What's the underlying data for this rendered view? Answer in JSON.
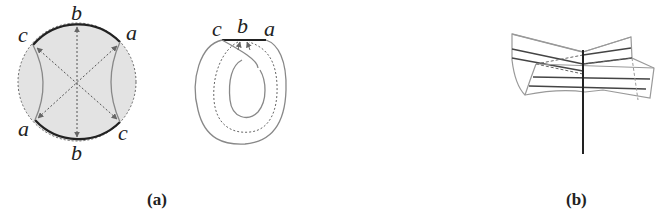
{
  "figure": {
    "panel_a": {
      "caption": "(a)",
      "disk_labels": {
        "top": "b",
        "bottom": "b",
        "upper_left": "c",
        "upper_right": "a",
        "lower_left": "a",
        "lower_right": "c"
      },
      "loop_labels": {
        "left": "c",
        "middle": "b",
        "right": "a"
      }
    },
    "panel_b": {
      "caption": "(b)"
    },
    "colors": {
      "fill": "#e3e3e3",
      "edge": "#222222",
      "gray_line": "#888888"
    }
  }
}
